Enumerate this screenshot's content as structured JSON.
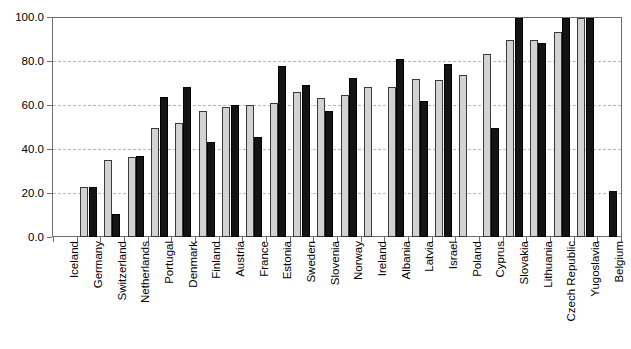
{
  "chart_data": {
    "type": "bar",
    "title": "",
    "xlabel": "",
    "ylabel": "",
    "ylim": [
      0,
      100
    ],
    "yticks": [
      "0.0",
      "20.0",
      "40.0",
      "60.0",
      "80.0",
      "100.0"
    ],
    "grid": true,
    "legend": "none",
    "categories": [
      "Iceland",
      "Germany",
      "Switzerland",
      "Netherlands",
      "Portugal",
      "Denmark",
      "Finland",
      "Austria",
      "France",
      "Estonia",
      "Sweden",
      "Slovenia",
      "Norway",
      "Ireland",
      "Albania",
      "Latvia",
      "Israel",
      "Poland",
      "Cyprus",
      "Slovakia",
      "Lithuania",
      "Czech Republic",
      "Yugoslavia",
      "Belgium"
    ],
    "series": [
      {
        "name": "series-1",
        "color": "#d2d2d2",
        "values": [
          null,
          23.0,
          35.0,
          36.5,
          50.0,
          52.0,
          57.5,
          59.5,
          60.5,
          61.0,
          66.0,
          63.5,
          65.0,
          68.5,
          68.5,
          72.0,
          71.5,
          74.0,
          83.5,
          90.0,
          90.0,
          93.5,
          100.0,
          null
        ]
      },
      {
        "name": "series-2",
        "color": "#141414",
        "values": [
          null,
          22.8,
          10.5,
          37.0,
          64.0,
          68.5,
          43.5,
          60.5,
          45.5,
          78.0,
          69.5,
          57.5,
          72.5,
          null,
          81.5,
          62.0,
          79.0,
          null,
          50.0,
          100.0,
          88.5,
          100.0,
          100.0,
          21.0
        ]
      }
    ]
  },
  "axis": {
    "y_tick_values": [
      0,
      20,
      40,
      60,
      80,
      100
    ]
  }
}
